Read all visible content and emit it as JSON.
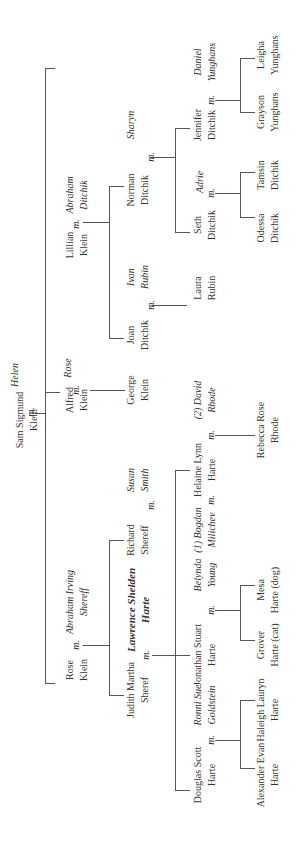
{
  "marriage_marker": "m.",
  "people": [
    {
      "id": "sam",
      "l1": "Sam Sigmund",
      "l2": "Klein",
      "x": 27,
      "y": 420,
      "type": "member"
    },
    {
      "id": "helen",
      "l1": "Helen",
      "l2": "",
      "x": 15,
      "y": 375,
      "type": "spouse"
    },
    {
      "id": "lillian",
      "l1": "Lillian",
      "l2": "Klein",
      "x": 77,
      "y": 245,
      "type": "member"
    },
    {
      "id": "abraham_d",
      "l1": "Abraham",
      "l2": "Ditchik",
      "x": 77,
      "y": 195,
      "type": "spouse"
    },
    {
      "id": "alfred",
      "l1": "Alfred",
      "l2": "Klein",
      "x": 77,
      "y": 400,
      "type": "member"
    },
    {
      "id": "rose_w",
      "l1": "Rose",
      "l2": "",
      "x": 68,
      "y": 368,
      "type": "spouse"
    },
    {
      "id": "rose",
      "l1": "Rose",
      "l2": "Klein",
      "x": 77,
      "y": 670,
      "type": "member"
    },
    {
      "id": "abraham_s",
      "l1": "Abraham Irving",
      "l2": "Shereff",
      "x": 77,
      "y": 602,
      "type": "spouse"
    },
    {
      "id": "norman",
      "l1": "Norman",
      "l2": "Ditchik",
      "x": 138,
      "y": 190,
      "type": "member"
    },
    {
      "id": "sharyn",
      "l1": "Sharyn",
      "l2": "",
      "x": 131,
      "y": 125,
      "type": "spouse"
    },
    {
      "id": "joan",
      "l1": "Joan",
      "l2": "Ditchik",
      "x": 138,
      "y": 335,
      "type": "member"
    },
    {
      "id": "ivan",
      "l1": "Ivan",
      "l2": "Rubin",
      "x": 138,
      "y": 277,
      "type": "spouse"
    },
    {
      "id": "george",
      "l1": "George",
      "l2": "Klein",
      "x": 138,
      "y": 390,
      "type": "member"
    },
    {
      "id": "richard",
      "l1": "Richard",
      "l2": "Shereff",
      "x": 138,
      "y": 540,
      "type": "member"
    },
    {
      "id": "susan",
      "l1": "Susan",
      "l2": "Smith",
      "x": 138,
      "y": 480,
      "type": "spouse"
    },
    {
      "id": "lawrence",
      "l1": "Lawrence Shelden",
      "l2": "Harte",
      "x": 138,
      "y": 610,
      "type": "bold"
    },
    {
      "id": "judith",
      "l1": "Judith Martha",
      "l2": "Sheref",
      "x": 138,
      "y": 690,
      "type": "member"
    },
    {
      "id": "jennifer",
      "l1": "Jennifer",
      "l2": "Ditchik",
      "x": 205,
      "y": 125,
      "type": "member"
    },
    {
      "id": "daniel",
      "l1": "Daniel",
      "l2": "Yunghans",
      "x": 205,
      "y": 62,
      "type": "spouse"
    },
    {
      "id": "seth",
      "l1": "Seth",
      "l2": "Ditchik",
      "x": 205,
      "y": 225,
      "type": "member"
    },
    {
      "id": "adrie",
      "l1": "Adrie",
      "l2": "",
      "x": 200,
      "y": 182,
      "type": "spouse"
    },
    {
      "id": "laura",
      "l1": "Laura",
      "l2": "Rubin",
      "x": 205,
      "y": 288,
      "type": "member"
    },
    {
      "id": "helaine",
      "l1": "Helaine Lynn",
      "l2": "Harte",
      "x": 205,
      "y": 470,
      "type": "member"
    },
    {
      "id": "david",
      "l1": "(2) David",
      "l2": "Rhode",
      "x": 205,
      "y": 400,
      "type": "spouse"
    },
    {
      "id": "bogdan",
      "l1": "(1) Bogdan",
      "l2": "Milichev",
      "x": 205,
      "y": 530,
      "type": "spouse"
    },
    {
      "id": "jonathan",
      "l1": "Jonathan Stuart",
      "l2": "Harte",
      "x": 205,
      "y": 655,
      "type": "member"
    },
    {
      "id": "belynda",
      "l1": "Belynda",
      "l2": "Young",
      "x": 205,
      "y": 575,
      "type": "spouse"
    },
    {
      "id": "douglas",
      "l1": "Douglas Scott",
      "l2": "Harte",
      "x": 205,
      "y": 775,
      "type": "member"
    },
    {
      "id": "ronni",
      "l1": "Ronni Sue",
      "l2": "Goldstein",
      "x": 205,
      "y": 705,
      "type": "spouse"
    },
    {
      "id": "leigha",
      "l1": "Leigha",
      "l2": "Yunghans",
      "x": 268,
      "y": 55,
      "type": "member"
    },
    {
      "id": "grayson",
      "l1": "Grayson",
      "l2": "Yunghans",
      "x": 268,
      "y": 112,
      "type": "member"
    },
    {
      "id": "tamsin",
      "l1": "Tamsin",
      "l2": "Ditchik",
      "x": 268,
      "y": 175,
      "type": "member"
    },
    {
      "id": "odessa",
      "l1": "Odessa",
      "l2": "Ditchik",
      "x": 268,
      "y": 228,
      "type": "member"
    },
    {
      "id": "rebecca",
      "l1": "Rebecca Rose",
      "l2": "Rhode",
      "x": 268,
      "y": 430,
      "type": "member"
    },
    {
      "id": "mesa",
      "l1": "Mesa",
      "l2": "Harte (dog)",
      "x": 268,
      "y": 590,
      "type": "member"
    },
    {
      "id": "grover",
      "l1": "Grover",
      "l2": "Harte (cat)",
      "x": 268,
      "y": 645,
      "type": "member"
    },
    {
      "id": "haleigh",
      "l1": "Haleigh Lauryn",
      "l2": "Harte",
      "x": 268,
      "y": 710,
      "type": "member"
    },
    {
      "id": "alexander",
      "l1": "Alexander Evan",
      "l2": "Harte",
      "x": 268,
      "y": 775,
      "type": "member"
    }
  ],
  "marriages": [
    {
      "x": 30,
      "y": 412
    },
    {
      "x": 75,
      "y": 224
    },
    {
      "x": 75,
      "y": 390
    },
    {
      "x": 75,
      "y": 645
    },
    {
      "x": 150,
      "y": 157
    },
    {
      "x": 150,
      "y": 305
    },
    {
      "x": 150,
      "y": 505
    },
    {
      "x": 145,
      "y": 655
    },
    {
      "x": 210,
      "y": 100
    },
    {
      "x": 210,
      "y": 193
    },
    {
      "x": 210,
      "y": 435
    },
    {
      "x": 210,
      "y": 500
    },
    {
      "x": 210,
      "y": 610
    },
    {
      "x": 210,
      "y": 740
    }
  ],
  "lines": [
    {
      "x": 35,
      "y": 413,
      "w": 10,
      "h": 1
    },
    {
      "x": 45,
      "y": 68,
      "w": 1,
      "h": 615
    },
    {
      "x": 45,
      "y": 68,
      "w": 10,
      "h": 1
    },
    {
      "x": 45,
      "y": 392,
      "w": 15,
      "h": 1
    },
    {
      "x": 45,
      "y": 683,
      "w": 10,
      "h": 1
    },
    {
      "x": 83,
      "y": 222,
      "w": 26,
      "h": 1
    },
    {
      "x": 109,
      "y": 186,
      "w": 1,
      "h": 152
    },
    {
      "x": 109,
      "y": 186,
      "w": 15,
      "h": 1
    },
    {
      "x": 109,
      "y": 338,
      "w": 15,
      "h": 1
    },
    {
      "x": 90,
      "y": 390,
      "w": 35,
      "h": 1
    },
    {
      "x": 83,
      "y": 645,
      "w": 26,
      "h": 1
    },
    {
      "x": 109,
      "y": 540,
      "w": 1,
      "h": 155
    },
    {
      "x": 109,
      "y": 540,
      "w": 15,
      "h": 1
    },
    {
      "x": 109,
      "y": 695,
      "w": 15,
      "h": 1
    },
    {
      "x": 150,
      "y": 157,
      "w": 25,
      "h": 1
    },
    {
      "x": 175,
      "y": 128,
      "w": 1,
      "h": 104
    },
    {
      "x": 175,
      "y": 128,
      "w": 15,
      "h": 1
    },
    {
      "x": 175,
      "y": 232,
      "w": 15,
      "h": 1
    },
    {
      "x": 152,
      "y": 305,
      "w": 35,
      "h": 1
    },
    {
      "x": 152,
      "y": 655,
      "w": 23,
      "h": 1
    },
    {
      "x": 175,
      "y": 470,
      "w": 1,
      "h": 320
    },
    {
      "x": 175,
      "y": 470,
      "w": 15,
      "h": 1
    },
    {
      "x": 175,
      "y": 655,
      "w": 15,
      "h": 1
    },
    {
      "x": 175,
      "y": 790,
      "w": 15,
      "h": 1
    },
    {
      "x": 215,
      "y": 100,
      "w": 25,
      "h": 1
    },
    {
      "x": 240,
      "y": 58,
      "w": 1,
      "h": 54
    },
    {
      "x": 240,
      "y": 58,
      "w": 15,
      "h": 1
    },
    {
      "x": 240,
      "y": 112,
      "w": 15,
      "h": 1
    },
    {
      "x": 215,
      "y": 193,
      "w": 25,
      "h": 1
    },
    {
      "x": 240,
      "y": 172,
      "w": 1,
      "h": 45
    },
    {
      "x": 240,
      "y": 172,
      "w": 15,
      "h": 1
    },
    {
      "x": 240,
      "y": 217,
      "w": 15,
      "h": 1
    },
    {
      "x": 215,
      "y": 435,
      "w": 40,
      "h": 1
    },
    {
      "x": 215,
      "y": 610,
      "w": 25,
      "h": 1
    },
    {
      "x": 240,
      "y": 585,
      "w": 1,
      "h": 55
    },
    {
      "x": 240,
      "y": 585,
      "w": 15,
      "h": 1
    },
    {
      "x": 240,
      "y": 640,
      "w": 15,
      "h": 1
    },
    {
      "x": 215,
      "y": 740,
      "w": 25,
      "h": 1
    },
    {
      "x": 240,
      "y": 700,
      "w": 1,
      "h": 68
    },
    {
      "x": 240,
      "y": 700,
      "w": 15,
      "h": 1
    },
    {
      "x": 240,
      "y": 768,
      "w": 15,
      "h": 1
    }
  ]
}
